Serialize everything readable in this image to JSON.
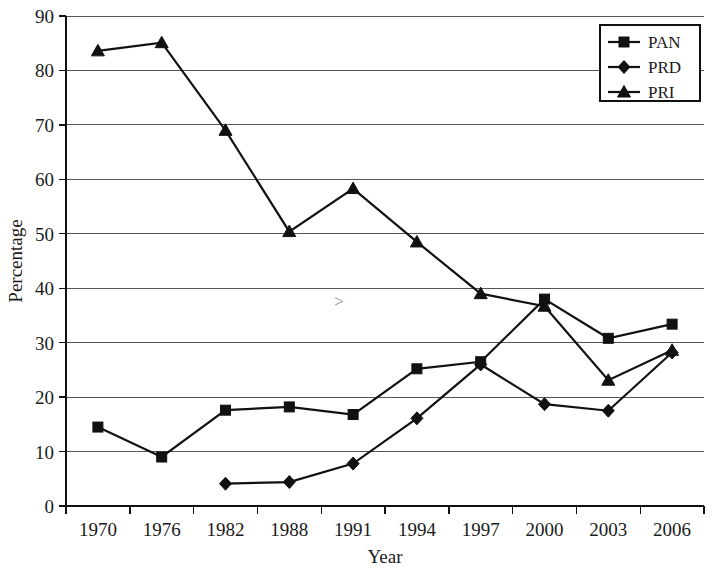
{
  "chart_data": {
    "type": "line",
    "title": "",
    "xlabel": "Year",
    "ylabel": "Percentage",
    "categories": [
      "1970",
      "1976",
      "1982",
      "1988",
      "1991",
      "1994",
      "1997",
      "2000",
      "2003",
      "2006"
    ],
    "ylim": [
      0,
      90
    ],
    "ytick_step": 10,
    "yticks": [
      "0",
      "10",
      "20",
      "30",
      "40",
      "50",
      "60",
      "70",
      "80",
      "90"
    ],
    "grid": true,
    "grid_axis": "y",
    "legend_position": "top-right",
    "series": [
      {
        "name": "PAN",
        "marker": "square",
        "values": [
          14.5,
          9.0,
          17.6,
          18.2,
          16.8,
          25.2,
          26.5,
          38.0,
          30.8,
          33.4
        ]
      },
      {
        "name": "PRD",
        "marker": "diamond",
        "values": [
          null,
          null,
          4.1,
          4.4,
          7.8,
          16.1,
          26.0,
          18.7,
          17.5,
          28.2
        ]
      },
      {
        "name": "PRI",
        "marker": "triangle",
        "values": [
          83.6,
          85.1,
          69.0,
          50.4,
          58.3,
          48.5,
          39.0,
          36.7,
          23.1,
          28.6
        ]
      }
    ],
    "annotations": [
      {
        "text": ">",
        "x_category": "1991",
        "y_value": 36.5
      }
    ],
    "colors": {
      "series_stroke": "#111111",
      "gridline": "#555555",
      "axis": "#111111",
      "background": "#ffffff"
    }
  },
  "axis_titles": {
    "x": "Year",
    "y": "Percentage"
  },
  "legend": {
    "entries": [
      {
        "label": "PAN"
      },
      {
        "label": "PRD"
      },
      {
        "label": "PRI"
      }
    ]
  }
}
